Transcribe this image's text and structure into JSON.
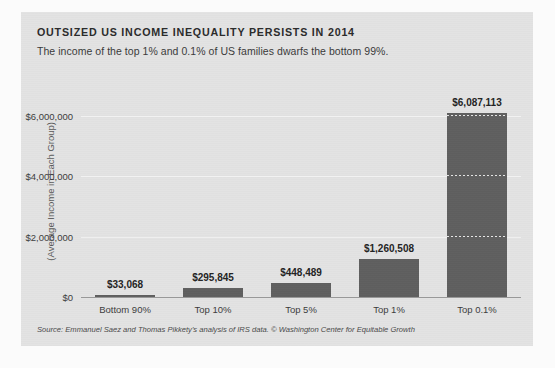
{
  "chart_data": {
    "type": "bar",
    "title": "OUTSIZED US INCOME INEQUALITY PERSISTS IN 2014",
    "subtitle": "The income of the top 1% and 0.1% of US families dwarfs the bottom 99%.",
    "xlabel": "",
    "ylabel": "(Average Income in Each Group)",
    "categories": [
      "Bottom 90%",
      "Top 10%",
      "Top 5%",
      "Top 1%",
      "Top 0.1%"
    ],
    "values": [
      33068,
      295845,
      448489,
      1260508,
      6087113
    ],
    "value_labels": [
      "$33,068",
      "$295,845",
      "$448,489",
      "$1,260,508",
      "$6,087,113"
    ],
    "ylim": [
      0,
      6500000
    ],
    "yticks": [
      0,
      2000000,
      4000000,
      6000000
    ],
    "ytick_labels": [
      "$0",
      "$2,000,000",
      "$4,000,000",
      "$6,000,000"
    ],
    "grid": true,
    "legend": "none",
    "bar_color": "#5f5f5f",
    "background_color": "#e3e3e3",
    "source": "Source: Emmanuel Saez and Thomas Pikkety's analysis of IRS data. © Washington Center for Equitable Growth"
  }
}
